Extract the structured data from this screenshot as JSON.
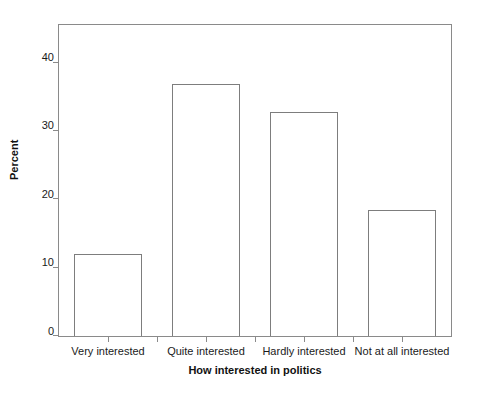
{
  "chart_data": {
    "type": "bar",
    "title": "",
    "subtitle": "",
    "xlabel": "How interested in politics",
    "ylabel": "Percent",
    "categories": [
      "Very interested",
      "Quite interested",
      "Hardly interested",
      "Not at all interested"
    ],
    "values": [
      12.0,
      36.9,
      32.8,
      18.5
    ],
    "ylim": [
      0,
      45.5
    ],
    "yticks": [
      0,
      10,
      20,
      30,
      40
    ],
    "ytick_labels": [
      "0",
      "10",
      "20",
      "30",
      "40"
    ],
    "grid": false,
    "legend": null,
    "legend_position": "none",
    "bar_fill_color": "#ffffff",
    "bar_border_color": "#7d7d7d",
    "axis_color": "#8a8a8a",
    "background_color": "#ffffff",
    "text_color": "#1a1a1a"
  }
}
